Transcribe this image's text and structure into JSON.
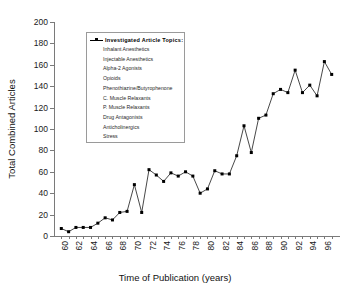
{
  "chart_data": {
    "type": "line",
    "title": "",
    "xlabel": "Time of Publication (years)",
    "ylabel": "Total Combined Articles",
    "xlim": [
      59,
      98
    ],
    "ylim": [
      0,
      200
    ],
    "grid": false,
    "legend_position": "upper-left-inside",
    "x_tick_labels": [
      "60",
      "62",
      "64",
      "66",
      "68",
      "70",
      "72",
      "74",
      "76",
      "78",
      "80",
      "82",
      "84",
      "86",
      "88",
      "90",
      "92",
      "94",
      "96"
    ],
    "x_tick_values": [
      60,
      62,
      64,
      66,
      68,
      70,
      72,
      74,
      76,
      78,
      80,
      82,
      84,
      86,
      88,
      90,
      92,
      94,
      96
    ],
    "y_tick_labels": [
      "0",
      "20",
      "40",
      "60",
      "80",
      "100",
      "120",
      "140",
      "160",
      "180",
      "200"
    ],
    "y_tick_values": [
      0,
      20,
      40,
      60,
      80,
      100,
      120,
      140,
      160,
      180,
      200
    ],
    "marker": "filled-square",
    "line_color": "#333333",
    "marker_color": "#000000",
    "series": [
      {
        "name": "Investigated Article Topics",
        "x": [
          60,
          61,
          62,
          63,
          64,
          65,
          66,
          67,
          68,
          69,
          70,
          71,
          72,
          73,
          74,
          75,
          76,
          77,
          78,
          79,
          80,
          81,
          82,
          83,
          84,
          85,
          86,
          87,
          88,
          89,
          90,
          91,
          92,
          93,
          94,
          95,
          96,
          97
        ],
        "values": [
          7,
          4,
          8,
          8,
          8,
          12,
          17,
          15,
          22,
          23,
          48,
          22,
          62,
          57,
          51,
          59,
          56,
          60,
          56,
          40,
          44,
          61,
          58,
          58,
          75,
          103,
          78,
          110,
          113,
          133,
          137,
          134,
          155,
          134,
          141,
          131,
          163,
          151
        ]
      }
    ]
  },
  "legend": {
    "title": "Investigated  Article  Topics:",
    "marker_name": "filled-square-marker",
    "entries": [
      "Inhalant Anesthetics",
      "Injectable Anesthetics",
      "Alpha-2 Agonists",
      "Opioids",
      "Phenothiazine/Butyrophenone",
      "C. Muscle Relaxants",
      "P. Muscle Relaxants",
      "Drug Antagonists",
      "Anticholinergics",
      "Stress"
    ]
  }
}
